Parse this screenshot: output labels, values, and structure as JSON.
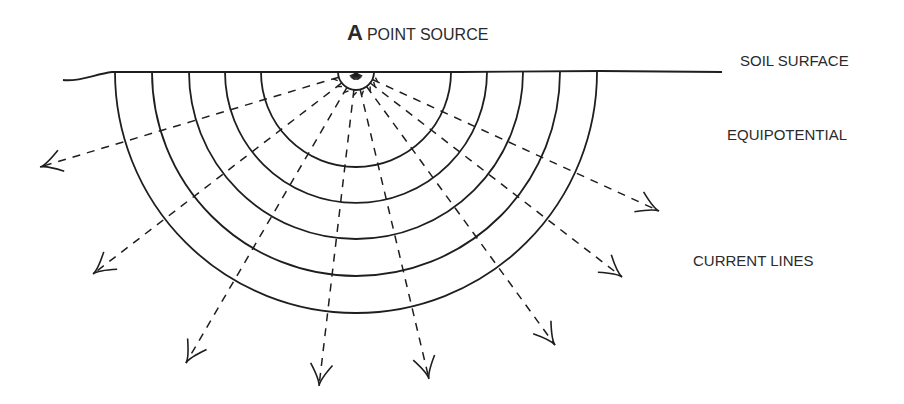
{
  "title": {
    "letter": "A",
    "text": "POINT SOURCE"
  },
  "labels": {
    "soil_surface": "SOIL SURFACE",
    "equipotential": "EQUIPOTENTIAL",
    "current_lines": "CURRENT LINES"
  },
  "geometry": {
    "source_center": [
      356,
      72
    ],
    "stroke_color": "#1e1e1e",
    "inner_radius": 18,
    "equipotential_radii": [
      95,
      131,
      167,
      204,
      241
    ],
    "surface_path": "M63,80 C80,82 95,74 112,72 L300,72 L460,72 L600,71 L722,72",
    "arrow_tips": [
      [
        40,
        167
      ],
      [
        93,
        274
      ],
      [
        186,
        363
      ],
      [
        319,
        386
      ],
      [
        429,
        379
      ],
      [
        555,
        345
      ],
      [
        622,
        277
      ],
      [
        659,
        211
      ]
    ]
  }
}
